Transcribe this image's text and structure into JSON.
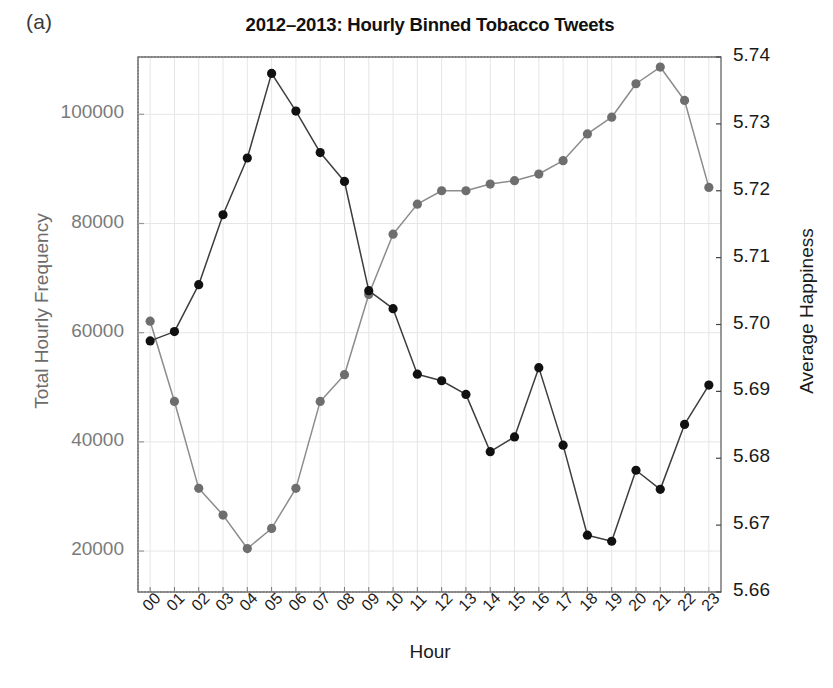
{
  "figure": {
    "panel_label": "(a)",
    "title": "2012–2013: Hourly Binned Tobacco Tweets",
    "xlabel": "Hour",
    "ylabel_left": "Total Hourly Frequency",
    "ylabel_right": "Average Happiness",
    "colors": {
      "frequency_line": "#3d3d3d",
      "frequency_marker": "#111111",
      "happiness_line": "#8c8c8c",
      "happiness_marker": "#6e6e6e",
      "grid": "#e6e6e6",
      "axis": "#555555",
      "left_tick_text": "#7a7a7a",
      "right_tick_text": "#1a1a1a"
    }
  },
  "axes": {
    "left_ticks": [
      "20000",
      "40000",
      "60000",
      "80000",
      "100000"
    ],
    "left_tick_values": [
      20000,
      40000,
      60000,
      80000,
      100000
    ],
    "right_ticks": [
      "5.66",
      "5.67",
      "5.68",
      "5.69",
      "5.70",
      "5.71",
      "5.72",
      "5.73",
      "5.74"
    ],
    "right_tick_values": [
      5.66,
      5.67,
      5.68,
      5.69,
      5.7,
      5.71,
      5.72,
      5.73,
      5.74
    ]
  },
  "chart_data": {
    "type": "line",
    "title": "2012–2013: Hourly Binned Tobacco Tweets",
    "xlabel": "Hour",
    "ylabel": "Total Hourly Frequency",
    "ylabel_right": "Average Happiness",
    "grid": true,
    "legend": "none",
    "x": [
      "00",
      "01",
      "02",
      "03",
      "04",
      "05",
      "06",
      "07",
      "08",
      "09",
      "10",
      "11",
      "12",
      "13",
      "14",
      "15",
      "16",
      "17",
      "18",
      "19",
      "20",
      "21",
      "22",
      "23"
    ],
    "xlim": [
      -0.5,
      23.5
    ],
    "ylim": [
      12500,
      110500
    ],
    "ylim_right": [
      5.66,
      5.74
    ],
    "series": [
      {
        "name": "Total Hourly Frequency",
        "axis": "left",
        "color": "#3d3d3d",
        "values": [
          58500,
          60200,
          68800,
          81600,
          92000,
          107500,
          100600,
          93000,
          87700,
          67700,
          64400,
          52400,
          51200,
          48700,
          38200,
          40900,
          53600,
          39400,
          22900,
          21800,
          34800,
          31300,
          43200,
          50400
        ]
      },
      {
        "name": "Average Happiness",
        "axis": "right",
        "color": "#8c8c8c",
        "values": [
          5.7005,
          5.6885,
          5.6755,
          5.6715,
          5.6665,
          5.6695,
          5.6755,
          5.6885,
          5.6925,
          5.7045,
          5.7135,
          5.718,
          5.72,
          5.72,
          5.721,
          5.7215,
          5.7225,
          5.7245,
          5.7285,
          5.731,
          5.736,
          5.7385,
          5.7335,
          5.7205
        ]
      }
    ]
  }
}
